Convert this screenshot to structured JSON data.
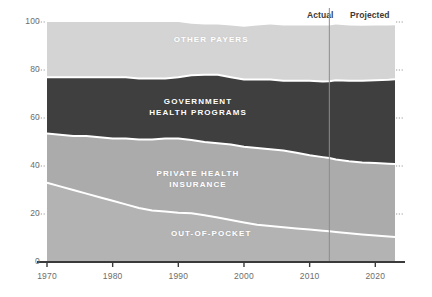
{
  "header": {
    "actual_label": "Actual",
    "projected_label": "Projected"
  },
  "chart_data": {
    "type": "area",
    "title": "",
    "subtitle": "",
    "xlabel": "",
    "ylabel": "",
    "stacked": true,
    "percent": true,
    "grid": true,
    "grid_style": "dotted-ticks",
    "legend_position": "inline-labels",
    "xlim": [
      1970,
      2023
    ],
    "ylim": [
      0,
      100
    ],
    "yticks": [
      0,
      20,
      40,
      60,
      80,
      100
    ],
    "ytick_labels": [
      "0",
      "20",
      "40",
      "60",
      "80",
      "100"
    ],
    "xticks": [
      1970,
      1980,
      1990,
      2000,
      2010,
      2020
    ],
    "xtick_labels": [
      "1970",
      "1980",
      "1990",
      "2000",
      "2010",
      "2020"
    ],
    "divider": {
      "x": 2013,
      "left_label": "Actual",
      "right_label": "Projected"
    },
    "x": [
      1970,
      1972,
      1974,
      1976,
      1978,
      1980,
      1982,
      1984,
      1986,
      1988,
      1990,
      1992,
      1994,
      1996,
      1998,
      2000,
      2002,
      2004,
      2006,
      2008,
      2010,
      2012,
      2013,
      2014,
      2016,
      2018,
      2020,
      2022,
      2023
    ],
    "series": [
      {
        "name": "OUT-OF-POCKET",
        "label": "OUT-OF-POCKET",
        "color": "#b3b3b3",
        "values": [
          33,
          31.5,
          30,
          28.5,
          27,
          25.5,
          24,
          22.5,
          21.5,
          21,
          20.5,
          20.3,
          19.5,
          18.5,
          17.5,
          16.5,
          15.5,
          15,
          14.5,
          14,
          13.5,
          13,
          12.8,
          12.5,
          12,
          11.5,
          11,
          10.6,
          10.4
        ]
      },
      {
        "name": "PRIVATE HEALTH INSURANCE",
        "label": "PRIVATE HEALTH\nINSURANCE",
        "color": "#ababab",
        "values": [
          20.5,
          21.5,
          22.5,
          24,
          25,
          26,
          27.5,
          28.5,
          29.5,
          30.5,
          31,
          30.5,
          30.5,
          31,
          31.5,
          31.5,
          32,
          32,
          32,
          31.5,
          31,
          30.7,
          30.5,
          30.2,
          30,
          30,
          30.2,
          30.3,
          30.4
        ]
      },
      {
        "name": "GOVERNMENT HEALTH PROGRAMS",
        "label": "GOVERNMENT\nHEALTH PROGRAMS",
        "color": "#3f3f3f",
        "values": [
          23.5,
          24,
          24.5,
          24.5,
          25,
          25.5,
          25.5,
          25.5,
          25.5,
          25,
          25.5,
          27,
          28,
          28.5,
          28,
          28,
          28.5,
          29,
          29,
          30,
          31,
          31.5,
          32,
          33,
          33.5,
          34,
          34.5,
          35,
          35.3
        ]
      },
      {
        "name": "OTHER PAYERS",
        "label": "OTHER PAYERS",
        "color": "#d4d4d4",
        "values": [
          23,
          23,
          23,
          23,
          23,
          23,
          23,
          23.5,
          23.5,
          23.5,
          23,
          21.5,
          21,
          21,
          21.5,
          22,
          22.5,
          23,
          23,
          23,
          23,
          23.3,
          23.2,
          23.3,
          23,
          22.9,
          22.8,
          22.6,
          22.5
        ]
      }
    ],
    "annotations": [
      {
        "text": "OTHER PAYERS",
        "x": 1995,
        "y": 90
      },
      {
        "text": "GOVERNMENT HEALTH PROGRAMS",
        "x": 1993,
        "y": 64
      },
      {
        "text": "PRIVATE HEALTH INSURANCE",
        "x": 1993,
        "y": 34
      },
      {
        "text": "OUT-OF-POCKET",
        "x": 1995,
        "y": 9
      }
    ]
  },
  "colors": {
    "background": "#ffffff",
    "other_payers": "#d4d4d4",
    "government": "#3f3f3f",
    "private": "#ababab",
    "out_of_pocket": "#b3b3b3",
    "axis": "#3a3a3a",
    "tick_text": "#6d6d6d",
    "separator": "#ffffff",
    "divider": "#8c8c8c"
  }
}
